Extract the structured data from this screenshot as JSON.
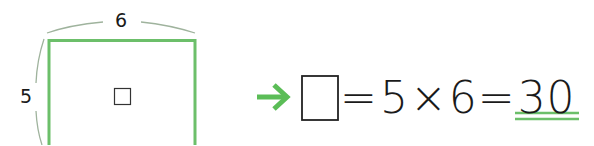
{
  "figure": {
    "rectangle": {
      "width_label": "6",
      "height_label": "5",
      "center_symbol": "□",
      "stroke_color": "#6cbf6a"
    },
    "arrow": {
      "icon": "right-arrow-icon",
      "color": "#5bbd57"
    },
    "equation": {
      "unknown": "□",
      "parts": [
        "=",
        "5",
        "×",
        "6",
        "="
      ],
      "answer": "30",
      "answer_underline_color": "#6cbf6a"
    },
    "colors": {
      "green": "#6cbf6a",
      "arc_gray": "#9aa59a",
      "text": "#1a1a1a"
    }
  }
}
